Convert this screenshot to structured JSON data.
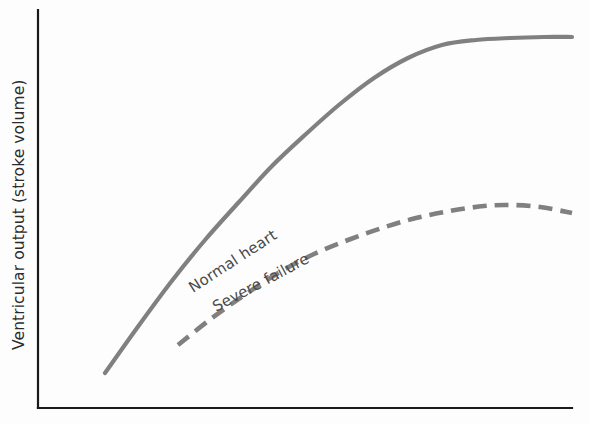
{
  "figure": {
    "background_color": "#fdfdfd",
    "axis_color": "#1a1a1a",
    "curve_color": "#808080"
  },
  "chart_data": {
    "type": "line",
    "title": "",
    "subtitle": "",
    "xlabel": "",
    "ylabel": "Ventricular output (stroke volume)",
    "grid": false,
    "legend_position": "inline-curve-labels",
    "axis_ticks": {
      "x": [],
      "y": []
    },
    "xlim": [
      0,
      100
    ],
    "ylim": [
      0,
      100
    ],
    "annotations": [
      {
        "text": "Normal heart",
        "attached_to": "Normal heart",
        "rotation_deg": -33,
        "x_px": 193,
        "y_px": 293
      },
      {
        "text": "Severe failure",
        "attached_to": "Severe failure",
        "rotation_deg": -28,
        "x_px": 216,
        "y_px": 312
      }
    ],
    "series": [
      {
        "name": "Normal heart",
        "style": "solid",
        "color": "#808080",
        "label": "Normal heart",
        "x": [
          12.6,
          20.0,
          28.0,
          36.0,
          44.0,
          52.0,
          60.0,
          68.0,
          76.0,
          84.0,
          92.0,
          100.0
        ],
        "y": [
          8.8,
          20.0,
          31.5,
          42.0,
          51.5,
          60.5,
          68.5,
          76.0,
          82.5,
          87.5,
          90.8,
          92.0
        ],
        "points_px": [
          [
            105,
            373
          ],
          [
            137,
            328
          ],
          [
            171,
            282
          ],
          [
            205,
            240
          ],
          [
            239,
            202
          ],
          [
            272,
            166
          ],
          [
            306,
            134
          ],
          [
            340,
            104
          ],
          [
            374,
            78
          ],
          [
            408,
            58
          ],
          [
            442,
            45
          ],
          [
            476,
            40
          ],
          [
            510,
            38
          ],
          [
            544,
            37
          ],
          [
            572,
            37
          ]
        ]
      },
      {
        "name": "Severe failure",
        "style": "dashed",
        "color": "#808080",
        "label": "Severe failure",
        "dash_length_px": 14,
        "gap_length_px": 8,
        "x": [
          30.0,
          38.0,
          46.0,
          54.0,
          62.0,
          70.0,
          78.0,
          86.0,
          94.0,
          100.0
        ],
        "y": [
          15.9,
          24.0,
          31.5,
          38.0,
          43.5,
          47.5,
          50.0,
          51.0,
          50.6,
          49.4
        ],
        "points_px": [
          [
            178,
            345
          ],
          [
            212,
            318
          ],
          [
            246,
            294
          ],
          [
            280,
            272
          ],
          [
            314,
            254
          ],
          [
            348,
            240
          ],
          [
            382,
            228
          ],
          [
            416,
            218
          ],
          [
            450,
            211
          ],
          [
            484,
            206
          ],
          [
            510,
            205
          ],
          [
            540,
            207
          ],
          [
            572,
            213
          ]
        ]
      }
    ]
  },
  "axes": {
    "y_axis": {
      "label": "Ventricular output (stroke volume)",
      "x_px": 38,
      "top_px": 10,
      "bottom_px": 408
    },
    "x_axis": {
      "label": "",
      "y_px": 408,
      "left_px": 38,
      "right_px": 572
    }
  }
}
